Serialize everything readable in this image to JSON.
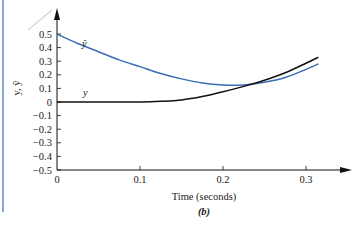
{
  "chart_data": {
    "type": "line",
    "title": "",
    "caption": "(b)",
    "xlabel": "Time (seconds)",
    "ylabel": "y, ŷ",
    "xlim": [
      0,
      0.33
    ],
    "ylim": [
      -0.5,
      0.5
    ],
    "x_ticks": [
      0,
      0.1,
      0.2,
      0.3
    ],
    "x_tick_labels": [
      "0",
      "0.1",
      "0.2",
      "0.3"
    ],
    "y_ticks": [
      0.5,
      0.4,
      0.3,
      0.2,
      0.1,
      0,
      -0.1,
      -0.2,
      -0.3,
      -0.4,
      -0.5
    ],
    "y_tick_labels": [
      "0.5",
      "0.4",
      "0.3",
      "0.2",
      "0.1",
      "0",
      "−0.1",
      "−0.2",
      "−0.3",
      "−0.4",
      "−0.5"
    ],
    "grid": false,
    "legend": "inline labels",
    "series": [
      {
        "name": "ŷ",
        "color": "#3a6db5",
        "x": [
          0,
          0.025,
          0.05,
          0.075,
          0.1,
          0.125,
          0.15,
          0.175,
          0.2,
          0.225,
          0.25,
          0.275,
          0.3,
          0.315
        ],
        "values": [
          0.5,
          0.43,
          0.37,
          0.31,
          0.26,
          0.21,
          0.17,
          0.14,
          0.125,
          0.125,
          0.145,
          0.18,
          0.24,
          0.28
        ]
      },
      {
        "name": "y",
        "color": "#111111",
        "x": [
          0,
          0.025,
          0.05,
          0.075,
          0.1,
          0.125,
          0.15,
          0.175,
          0.2,
          0.225,
          0.25,
          0.275,
          0.3,
          0.315
        ],
        "values": [
          0,
          0,
          0,
          0,
          0,
          0.005,
          0.015,
          0.04,
          0.075,
          0.115,
          0.16,
          0.215,
          0.285,
          0.33
        ]
      }
    ]
  },
  "labels": {
    "yhat_label": "ŷ",
    "y_label": "y",
    "y_axis_title": "y, ŷ",
    "x_axis_title": "Time (seconds)",
    "caption": "(b)"
  },
  "colors": {
    "yhat": "#3a6db5",
    "y": "#111111",
    "frame_line": "#3a6db5"
  }
}
